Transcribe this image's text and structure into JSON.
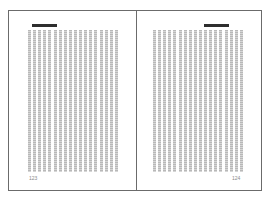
{
  "spread": {
    "left_page": {
      "page_number": "123",
      "column_count": 18
    },
    "right_page": {
      "page_number": "124",
      "column_count": 18
    }
  },
  "colors": {
    "border": "#6b6b6b",
    "header_bar": "#2e2e2e",
    "text_texture": "#b8b8b8",
    "page_number": "#8a8a8a"
  }
}
